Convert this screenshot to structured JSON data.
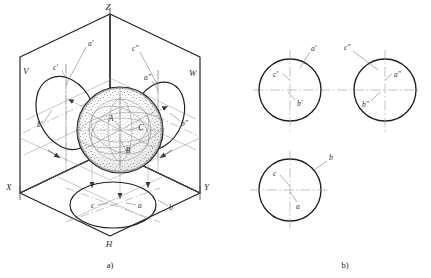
{
  "figure": {
    "panels": [
      {
        "id": "a",
        "caption": "a)",
        "description": "Pictorial (isometric) view of the three projection planes V, W, H with a sphere and its three elliptical projections"
      },
      {
        "id": "b",
        "caption": "b)",
        "description": "The three orthographic views of the sphere: front, side and top, each a circle with centre lines"
      }
    ],
    "line_color": "#1f1f1f",
    "thin_line_color": "#8a8a8a",
    "centerline_color": "#9a9a9a",
    "stipple_color": "#555555",
    "background": "#ffffff"
  },
  "panel_a": {
    "caption": "a)",
    "axes": [
      {
        "name": "axis-z",
        "label": "Z"
      },
      {
        "name": "axis-x",
        "label": "X"
      },
      {
        "name": "axis-y",
        "label": "Y"
      }
    ],
    "planes": [
      {
        "name": "plane-v",
        "label": "V"
      },
      {
        "name": "plane-w",
        "label": "W"
      },
      {
        "name": "plane-h",
        "label": "H"
      }
    ],
    "sphere_points": [
      {
        "name": "point-a",
        "label": "A"
      },
      {
        "name": "point-b",
        "label": "B"
      },
      {
        "name": "point-c",
        "label": "C"
      }
    ],
    "v_projection_labels": [
      {
        "name": "label-a-prime",
        "label": "a′"
      },
      {
        "name": "label-c-prime",
        "label": "c′"
      },
      {
        "name": "label-b-prime",
        "label": "b′"
      }
    ],
    "w_projection_labels": [
      {
        "name": "label-c-dprime",
        "label": "c″"
      },
      {
        "name": "label-a-dprime",
        "label": "a″"
      },
      {
        "name": "label-b-dprime",
        "label": "b″"
      }
    ],
    "h_projection_labels": [
      {
        "name": "label-c",
        "label": "c"
      },
      {
        "name": "label-a",
        "label": "a"
      },
      {
        "name": "label-b",
        "label": "b"
      }
    ]
  },
  "panel_b": {
    "caption": "b)",
    "views": [
      {
        "name": "front-view",
        "labels": [
          {
            "name": "label-a-prime",
            "label": "a′"
          },
          {
            "name": "label-c-prime",
            "label": "c′"
          },
          {
            "name": "label-b-prime",
            "label": "b′"
          }
        ]
      },
      {
        "name": "side-view",
        "labels": [
          {
            "name": "label-c-dprime",
            "label": "c″"
          },
          {
            "name": "label-a-dprime",
            "label": "a″"
          },
          {
            "name": "label-b-dprime",
            "label": "b″"
          }
        ]
      },
      {
        "name": "top-view",
        "labels": [
          {
            "name": "label-b",
            "label": "b"
          },
          {
            "name": "label-c",
            "label": "c"
          },
          {
            "name": "label-a",
            "label": "a"
          }
        ]
      }
    ]
  }
}
